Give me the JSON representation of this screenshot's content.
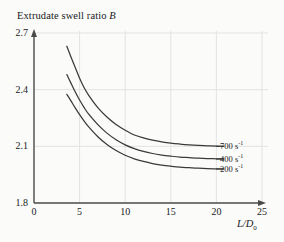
{
  "chart_data": {
    "type": "line",
    "title": "Extrudate swell ratio B",
    "title_plain": "Extrudate swell ratio ",
    "title_italic": "B",
    "xlabel": "L/D0",
    "xlabel_main": "L/D",
    "xlabel_sub": "0",
    "ylabel": "Extrudate swell ratio B",
    "xlim": [
      0,
      25
    ],
    "ylim": [
      1.8,
      2.7
    ],
    "xticks": [
      "0",
      "5",
      "10",
      "15",
      "20",
      "25"
    ],
    "xtick_values": [
      0,
      5,
      10,
      15,
      20,
      25
    ],
    "yticks": [
      "1.8",
      "2.1",
      "2.4",
      "2.7"
    ],
    "ytick_values": [
      1.8,
      2.1,
      2.4,
      2.7
    ],
    "grid": true,
    "grid_color": "#e3e3e1",
    "axis_color": "#4a4a4a",
    "curve_color": "#3a3a3a",
    "legend_position": "right-inline",
    "series": [
      {
        "name": "700 s-1",
        "label_main": "700 s",
        "label_sup": "-1",
        "x": [
          3.6,
          4.0,
          4.5,
          5.0,
          5.5,
          6.0,
          7.0,
          8.0,
          9.0,
          10.0,
          11.0,
          12.0,
          13.0,
          14.0,
          15.0,
          16.0,
          17.0,
          18.0,
          19.0,
          20.0,
          20.8
        ],
        "values": [
          2.63,
          2.58,
          2.52,
          2.46,
          2.41,
          2.37,
          2.305,
          2.255,
          2.215,
          2.185,
          2.16,
          2.145,
          2.133,
          2.124,
          2.117,
          2.112,
          2.108,
          2.105,
          2.103,
          2.101,
          2.1
        ]
      },
      {
        "name": "400 s-1",
        "label_main": "400 s",
        "label_sup": "-1",
        "x": [
          3.6,
          4.0,
          4.5,
          5.0,
          5.5,
          6.0,
          7.0,
          8.0,
          9.0,
          10.0,
          11.0,
          12.0,
          13.0,
          14.0,
          15.0,
          16.0,
          17.0,
          18.0,
          19.0,
          20.0,
          20.8
        ],
        "values": [
          2.48,
          2.44,
          2.39,
          2.345,
          2.305,
          2.27,
          2.215,
          2.17,
          2.135,
          2.108,
          2.088,
          2.073,
          2.062,
          2.054,
          2.048,
          2.043,
          2.04,
          2.037,
          2.035,
          2.034,
          2.033
        ]
      },
      {
        "name": "200 s-1",
        "label_main": "200 s",
        "label_sup": "-1",
        "x": [
          3.6,
          4.0,
          4.5,
          5.0,
          5.5,
          6.0,
          7.0,
          8.0,
          9.0,
          10.0,
          11.0,
          12.0,
          13.0,
          14.0,
          15.0,
          16.0,
          17.0,
          18.0,
          19.0,
          20.0,
          20.8
        ],
        "values": [
          2.375,
          2.345,
          2.305,
          2.268,
          2.234,
          2.203,
          2.151,
          2.11,
          2.078,
          2.053,
          2.034,
          2.02,
          2.009,
          2.001,
          1.995,
          1.99,
          1.987,
          1.984,
          1.982,
          1.981,
          1.98
        ]
      }
    ]
  }
}
